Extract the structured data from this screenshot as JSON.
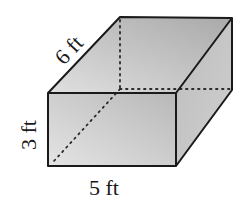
{
  "diagram": {
    "type": "rectangular-prism",
    "labels": {
      "depth": "6 ft",
      "height": "3 ft",
      "width": "5 ft"
    },
    "dimensions": {
      "length_ft": 6,
      "height_ft": 3,
      "width_ft": 5
    },
    "colors": {
      "edge": "#1a1a1a",
      "front_face": "#c8c8c8",
      "top_face": "#bdbdbd",
      "side_face": "#b0b0b0",
      "hidden_edge": "#333333"
    }
  }
}
